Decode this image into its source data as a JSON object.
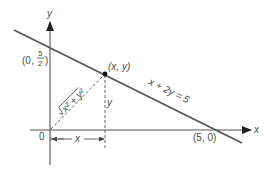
{
  "diagram": {
    "type": "coordinate-geometry",
    "axes": {
      "x_label": "x",
      "y_label": "y",
      "origin_label": "0"
    },
    "line": {
      "equation_label": "x + 2y = 5",
      "y_intercept_label_prefix": "(0,",
      "y_intercept_numerator": "5",
      "y_intercept_denominator": "2",
      "y_intercept_label_suffix": ")",
      "x_intercept_label": "(5, 0)"
    },
    "point": {
      "label": "(x, y)"
    },
    "distance": {
      "label": "√(x² + y²)",
      "radicand": "x² + y²"
    },
    "dimensions": {
      "horizontal_label": "x",
      "vertical_label": "y"
    },
    "colors": {
      "line": "#555555",
      "axis": "#555555",
      "text": "#4a4a4a",
      "point": "#111111",
      "background": "#ffffff"
    }
  }
}
